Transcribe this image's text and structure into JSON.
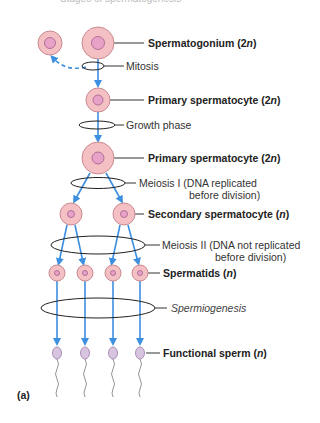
{
  "diagram": {
    "title_partial": "Stages of spermatogenesis",
    "panel_label": "(a)",
    "colors": {
      "cell_fill": "#f4c0c4",
      "cell_stroke": "#c98a90",
      "nucleus_fill": "#e8a2c8",
      "nucleus_stroke": "#a0608a",
      "sperm_fill": "#d9c4e0",
      "arrow": "#3d8fe0",
      "ellipse": "#222222"
    },
    "labels": [
      {
        "id": "spermatogonium",
        "text": "Spermatogonium (2",
        "ploidy": "n",
        "tail": ")",
        "style": "bold"
      },
      {
        "id": "mitosis",
        "text": "Mitosis",
        "style": "normal"
      },
      {
        "id": "primary1",
        "text": "Primary spermatocyte (2",
        "ploidy": "n",
        "tail": ")",
        "style": "bold"
      },
      {
        "id": "growth",
        "text": "Growth phase",
        "style": "normal"
      },
      {
        "id": "primary2",
        "text": "Primary spermatocyte (2",
        "ploidy": "n",
        "tail": ")",
        "style": "bold"
      },
      {
        "id": "meiosis1_a",
        "text": "Meiosis I (DNA replicated",
        "style": "normal"
      },
      {
        "id": "meiosis1_b",
        "text": "before division)",
        "style": "normal"
      },
      {
        "id": "secondary",
        "text": "Secondary spermatocyte (",
        "ploidy": "n",
        "tail": ")",
        "style": "bold"
      },
      {
        "id": "meiosis2_a",
        "text": "Meiosis II (DNA not replicated",
        "style": "normal"
      },
      {
        "id": "meiosis2_b",
        "text": "before division)",
        "style": "normal"
      },
      {
        "id": "spermatids",
        "text": "Spermatids (",
        "ploidy": "n",
        "tail": ")",
        "style": "bold"
      },
      {
        "id": "spermiogenesis",
        "text": "Spermiogenesis",
        "style": "italic"
      },
      {
        "id": "sperm",
        "text": "Functional sperm (",
        "ploidy": "n",
        "tail": ")",
        "style": "bold"
      }
    ]
  }
}
